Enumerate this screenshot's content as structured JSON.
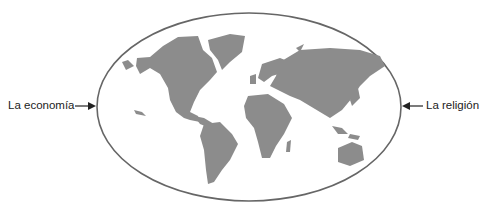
{
  "diagram": {
    "labels": {
      "left": "La economía",
      "right": "La religión"
    },
    "colors": {
      "land": "#8c8c8c",
      "outline": "#555555",
      "text": "#222222"
    }
  }
}
